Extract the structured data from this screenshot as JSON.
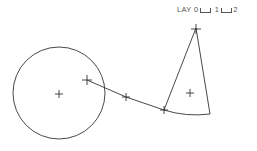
{
  "legend": {
    "prefix": "LAY",
    "layers": [
      "0",
      "1",
      "2"
    ]
  },
  "diagram": {
    "stroke": "#333333",
    "circle": {
      "cx": 59,
      "cy": 93,
      "r": 46
    },
    "crosses": [
      {
        "name": "circle-center",
        "x": 59,
        "y": 94,
        "size": 4
      },
      {
        "name": "line-start",
        "x": 87,
        "y": 80,
        "size": 5
      },
      {
        "name": "line-mid",
        "x": 126,
        "y": 97,
        "size": 4
      },
      {
        "name": "vertex",
        "x": 164,
        "y": 110,
        "size": 4
      },
      {
        "name": "apex",
        "x": 196,
        "y": 28,
        "size": 5
      },
      {
        "name": "sector-centroid",
        "x": 190,
        "y": 93,
        "size": 4
      }
    ]
  }
}
